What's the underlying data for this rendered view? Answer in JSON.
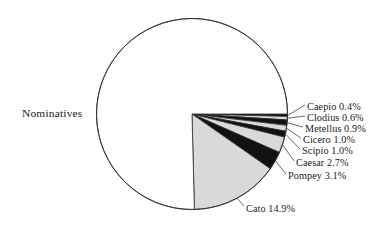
{
  "figure": {
    "center_label": "Nominatives",
    "background_color": "#ffffff",
    "outline_color": "#2b2b2b"
  },
  "chart_data": {
    "type": "pie",
    "title": "Nominatives",
    "xlabel": "",
    "ylabel": "",
    "unit": "%",
    "legend": "callout-labels-right",
    "grid": false,
    "start_angle_deg": 0,
    "direction": "clockwise",
    "categories": [
      "Caepio",
      "Clodius",
      "Metellus",
      "Cicero",
      "Scipio",
      "Caesar",
      "Pompey",
      "Cato",
      "Other"
    ],
    "values": [
      0.4,
      0.6,
      0.9,
      1.0,
      1.0,
      2.7,
      3.1,
      14.9,
      75.4
    ],
    "slices": [
      {
        "name": "Caepio",
        "value": 0.4,
        "label": "Caepio 0.4%",
        "fill": "#111111",
        "labeled": true
      },
      {
        "name": "Clodius",
        "value": 0.6,
        "label": "Clodius 0.6%",
        "fill": "#d9d9d9",
        "labeled": true
      },
      {
        "name": "Metellus",
        "value": 0.9,
        "label": "Metellus 0.9%",
        "fill": "#111111",
        "labeled": true
      },
      {
        "name": "Cicero",
        "value": 1.0,
        "label": "Cicero 1.0%",
        "fill": "#d9d9d9",
        "labeled": true
      },
      {
        "name": "Scipio",
        "value": 1.0,
        "label": "Scipio 1.0%",
        "fill": "#111111",
        "labeled": true
      },
      {
        "name": "Caesar",
        "value": 2.7,
        "label": "Caesar 2.7%",
        "fill": "#d9d9d9",
        "labeled": true
      },
      {
        "name": "Pompey",
        "value": 3.1,
        "label": "Pompey 3.1%",
        "fill": "#111111",
        "labeled": true
      },
      {
        "name": "Cato",
        "value": 14.9,
        "label": "Cato 14.9%",
        "fill": "#d9d9d9",
        "labeled": true
      },
      {
        "name": "Other",
        "value": 75.4,
        "label": "",
        "fill": "#ffffff",
        "labeled": false
      }
    ]
  }
}
